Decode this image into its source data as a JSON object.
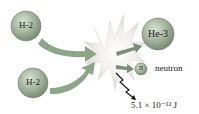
{
  "diagram": {
    "reactants": [
      {
        "label": "H-2"
      },
      {
        "label": "H-2"
      }
    ],
    "products": {
      "helium": {
        "label": "He-3"
      },
      "neutron": {
        "symbol": "n",
        "label": "neutron"
      }
    },
    "energy": {
      "label": "5.1 × 10⁻¹³ J"
    },
    "colors": {
      "particle": "#9cae96",
      "arrow_reactant": "#7f9a7b",
      "arrow_product": "#7a8f74",
      "burst": "#f3f0ee"
    }
  }
}
